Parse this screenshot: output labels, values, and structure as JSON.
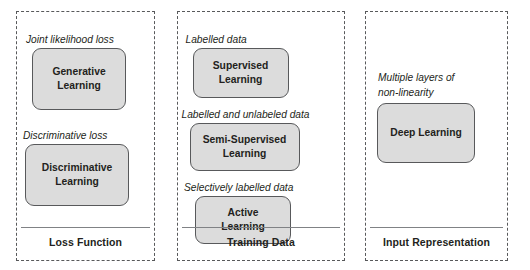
{
  "diagram": {
    "colors": {
      "panel_border": "#58595b",
      "node_fill": "#dcdcdc",
      "node_border": "#58595b",
      "divider": "#808285",
      "text": "#231f20",
      "background": "#ffffff"
    },
    "groups": [
      {
        "id": "loss-function",
        "footer_label": "Loss Function",
        "items": [
          {
            "caption": "Joint likelihood loss",
            "node_lines": [
              "Generative",
              "Learning"
            ]
          },
          {
            "caption": "Discriminative loss",
            "node_lines": [
              "Discriminative",
              "Learning"
            ]
          }
        ]
      },
      {
        "id": "training-data",
        "footer_label": "Training Data",
        "items": [
          {
            "caption": "Labelled data",
            "node_lines": [
              "Supervised",
              "Learning"
            ]
          },
          {
            "caption": "Labelled and unlabeled data",
            "node_lines": [
              "Semi-Supervised",
              "Learning"
            ]
          },
          {
            "caption": "Selectively labelled data",
            "node_lines": [
              "Active",
              "Learning"
            ]
          }
        ]
      },
      {
        "id": "input-representation",
        "footer_label": "Input Representation",
        "items": [
          {
            "caption_line_1": "Multiple layers of",
            "caption_line_2": "non-linearity",
            "node_lines": [
              "Deep Learning"
            ]
          }
        ]
      }
    ]
  }
}
